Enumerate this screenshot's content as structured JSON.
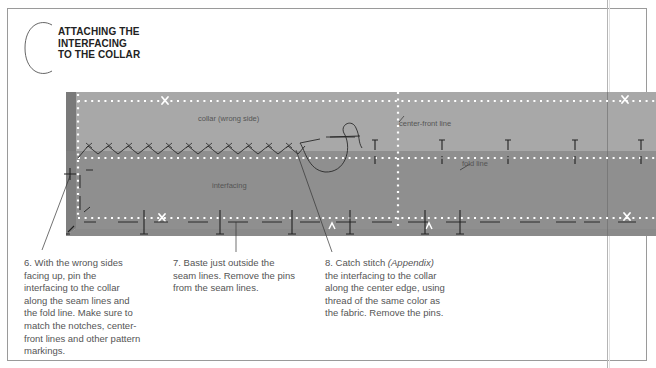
{
  "section": {
    "letter": "C",
    "title_lines": [
      "ATTACHING THE",
      "INTERFACING",
      "TO THE COLLAR"
    ]
  },
  "illustration": {
    "labels": {
      "collar": "collar (wrong side)",
      "interfacing": "interfacing",
      "center_front": "center-front line",
      "fold_line": "fold line"
    },
    "colors": {
      "collar_fabric": "#a8a8a8",
      "interfacing": "#8f8f8f",
      "shadow_edge": "#6e6e6e",
      "seam_dots": "#ffffff",
      "stitch_ink": "#222222"
    }
  },
  "steps": [
    {
      "number": "6.",
      "lines": [
        "With the wrong sides",
        "facing up, pin the",
        "interfacing to the collar",
        "along the seam lines and",
        "the fold line. Make sure to",
        "match the notches, center-",
        "front lines and other pattern",
        "markings."
      ]
    },
    {
      "number": "7.",
      "lines": [
        "Baste just outside the",
        "seam lines. Remove the pins",
        "from the seam lines."
      ]
    },
    {
      "number": "8.",
      "pre": "Catch stitch ",
      "ref": "(Appendix)",
      "lines": [
        "the interfacing to the collar",
        "along the center edge, using",
        "thread of the same color as",
        "the fabric. Remove the pins."
      ]
    }
  ]
}
